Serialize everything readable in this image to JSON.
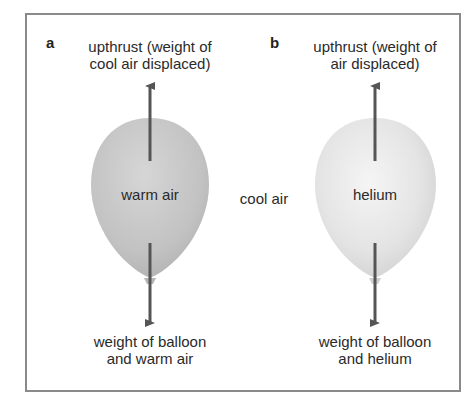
{
  "figure": {
    "panels": [
      {
        "letter": "a",
        "upthrust_line1": "upthrust (weight of",
        "upthrust_line2": "cool air displaced)",
        "balloon_label": "warm air",
        "weight_line1": "weight of balloon",
        "weight_line2": "and warm air",
        "balloon_color": "#c4c4c4"
      },
      {
        "letter": "b",
        "upthrust_line1": "upthrust (weight of",
        "upthrust_line2": "air displaced)",
        "balloon_label": "helium",
        "weight_line1": "weight of balloon",
        "weight_line2": "and helium",
        "balloon_color": "#e2e2e2"
      }
    ],
    "surrounding_label": "cool air",
    "arrow_color": "#555555",
    "border_color": "#8a8a8a"
  }
}
